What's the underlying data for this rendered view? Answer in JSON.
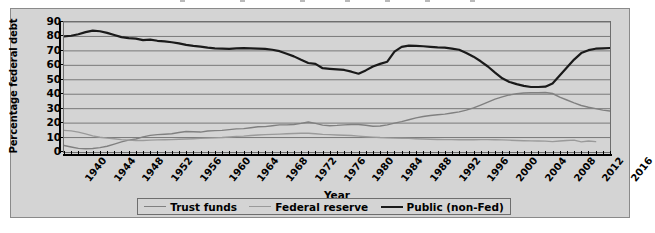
{
  "chart_data": {
    "type": "line",
    "title": "",
    "xlabel": "Year",
    "ylabel": "Percentage federal debt",
    "xlim": [
      1940,
      2016
    ],
    "ylim": [
      0,
      90
    ],
    "yticks": [
      0,
      10,
      20,
      30,
      40,
      50,
      60,
      70,
      80,
      90
    ],
    "xticks": [
      1940,
      1944,
      1948,
      1952,
      1956,
      1960,
      1964,
      1968,
      1972,
      1976,
      1980,
      1984,
      1988,
      1992,
      1996,
      2000,
      2004,
      2008,
      2012,
      2016
    ],
    "xtick_minor_step": 1,
    "grid": "horizontal",
    "legend_position": "bottom",
    "x": [
      1940,
      1941,
      1942,
      1943,
      1944,
      1945,
      1946,
      1947,
      1948,
      1949,
      1950,
      1951,
      1952,
      1953,
      1954,
      1955,
      1956,
      1957,
      1958,
      1959,
      1960,
      1961,
      1962,
      1963,
      1964,
      1965,
      1966,
      1967,
      1968,
      1969,
      1970,
      1971,
      1972,
      1973,
      1974,
      1975,
      1976,
      1977,
      1978,
      1979,
      1980,
      1981,
      1982,
      1983,
      1984,
      1985,
      1986,
      1987,
      1988,
      1989,
      1990,
      1991,
      1992,
      1993,
      1994,
      1995,
      1996,
      1997,
      1998,
      1999,
      2000,
      2001,
      2002,
      2003,
      2004,
      2005,
      2006,
      2007,
      2008,
      2009,
      2010,
      2011,
      2012,
      2013,
      2014,
      2015,
      2016
    ],
    "series": [
      {
        "name": "Trust funds",
        "color": "#808080",
        "width": 1.4,
        "values": [
          4.5,
          3.5,
          2.5,
          2.2,
          2.4,
          3.0,
          4.0,
          5.5,
          7.0,
          8.2,
          9.0,
          10.5,
          11.5,
          12.0,
          12.3,
          12.6,
          13.5,
          14.2,
          14.0,
          13.8,
          14.5,
          14.8,
          15.0,
          15.5,
          16.0,
          16.2,
          16.8,
          17.5,
          17.6,
          18.2,
          18.8,
          18.8,
          19.0,
          19.8,
          20.8,
          19.8,
          18.6,
          18.2,
          18.4,
          18.8,
          19.0,
          19.0,
          18.5,
          17.8,
          18.0,
          18.8,
          20.0,
          21.0,
          22.3,
          23.6,
          24.6,
          25.3,
          25.8,
          26.2,
          27.0,
          27.8,
          29.0,
          30.5,
          32.5,
          34.5,
          36.6,
          38.2,
          39.5,
          40.3,
          40.8,
          41.0,
          41.0,
          41.2,
          40.5,
          38.0,
          36.0,
          34.0,
          32.2,
          31.0,
          30.0,
          29.0,
          28.4
        ]
      },
      {
        "name": "Federal reserve",
        "color": "#9a9a9a",
        "width": 1.4,
        "values": [
          15.0,
          14.6,
          13.8,
          12.5,
          11.2,
          10.2,
          9.6,
          9.2,
          8.6,
          8.2,
          8.0,
          8.0,
          8.2,
          8.4,
          8.5,
          8.6,
          8.8,
          9.0,
          9.2,
          9.4,
          9.6,
          9.8,
          10.0,
          10.4,
          10.8,
          11.0,
          11.4,
          11.8,
          12.0,
          12.2,
          12.4,
          12.6,
          12.8,
          13.0,
          13.0,
          12.6,
          12.2,
          12.0,
          11.8,
          11.6,
          11.4,
          11.0,
          10.6,
          10.3,
          10.0,
          9.8,
          9.6,
          9.5,
          9.4,
          9.2,
          9.0,
          8.8,
          8.7,
          8.6,
          8.6,
          8.5,
          8.5,
          8.5,
          8.6,
          8.6,
          8.5,
          8.4,
          8.2,
          8.0,
          7.8,
          7.7,
          7.6,
          7.5,
          7.2,
          7.6,
          8.0,
          8.2,
          7.0,
          7.6,
          7.2,
          null,
          null
        ]
      },
      {
        "name": "Public (non-Fed)",
        "color": "#1a1a1a",
        "width": 2.2,
        "values": [
          80.0,
          80.5,
          81.5,
          83.0,
          84.0,
          83.6,
          82.5,
          81.0,
          79.5,
          78.8,
          78.5,
          77.5,
          77.8,
          77.0,
          76.6,
          76.0,
          75.2,
          74.2,
          73.5,
          73.0,
          72.2,
          71.8,
          71.6,
          71.4,
          71.8,
          71.9,
          71.8,
          71.6,
          71.4,
          70.8,
          69.8,
          68.0,
          66.2,
          63.8,
          61.6,
          61.0,
          58.0,
          57.6,
          57.2,
          56.8,
          55.6,
          54.2,
          56.5,
          59.2,
          61.0,
          62.5,
          69.5,
          72.8,
          73.6,
          73.5,
          73.2,
          72.8,
          72.4,
          72.2,
          71.6,
          70.8,
          68.6,
          66.0,
          62.8,
          59.2,
          55.0,
          51.0,
          48.5,
          47.0,
          45.8,
          45.0,
          45.0,
          45.2,
          47.5,
          53.0,
          58.5,
          64.0,
          68.5,
          70.5,
          71.5,
          71.8,
          72.0
        ]
      }
    ]
  },
  "axis": {
    "ylabel": "Percentage federal debt",
    "xlabel": "Year",
    "ytick_labels": [
      "90",
      "80",
      "70",
      "60",
      "50",
      "40",
      "30",
      "20",
      "10",
      "0"
    ],
    "xtick_labels": [
      "1940",
      "1944",
      "1948",
      "1952",
      "1956",
      "1960",
      "1964",
      "1968",
      "1972",
      "1976",
      "1980",
      "1984",
      "1988",
      "1992",
      "1996",
      "2000",
      "2004",
      "2008",
      "2012",
      "2016"
    ]
  },
  "legend": {
    "items": [
      {
        "label": "Trust funds",
        "color": "#808080",
        "width": 1.4
      },
      {
        "label": "Federal reserve",
        "color": "#9a9a9a",
        "width": 1.4
      },
      {
        "label": "Public (non-Fed)",
        "color": "#1a1a1a",
        "width": 2.4
      }
    ]
  },
  "colors": {
    "figure_background": "#d4d4d4",
    "plot_background": "#d4d4d4",
    "gridline": "#6e6e6e",
    "axis": "#000000",
    "page_background": "#ffffff"
  }
}
